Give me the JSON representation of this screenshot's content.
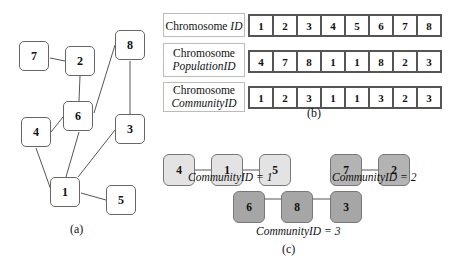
{
  "panel_a": {
    "caption": "(a)",
    "nodes": [
      {
        "id": "7",
        "label": "7"
      },
      {
        "id": "2",
        "label": "2"
      },
      {
        "id": "8",
        "label": "8"
      },
      {
        "id": "6",
        "label": "6"
      },
      {
        "id": "4",
        "label": "4"
      },
      {
        "id": "3",
        "label": "3"
      },
      {
        "id": "1",
        "label": "1"
      },
      {
        "id": "5",
        "label": "5"
      }
    ],
    "edges": [
      [
        "7",
        "2"
      ],
      [
        "2",
        "6"
      ],
      [
        "6",
        "4"
      ],
      [
        "6",
        "8"
      ],
      [
        "6",
        "1"
      ],
      [
        "8",
        "3"
      ],
      [
        "3",
        "1"
      ],
      [
        "4",
        "1"
      ],
      [
        "1",
        "5"
      ]
    ]
  },
  "panel_b": {
    "caption": "(b)",
    "rows": [
      {
        "label_plain": "Chromosome ",
        "label_italic": "ID",
        "values": [
          "1",
          "2",
          "3",
          "4",
          "5",
          "6",
          "7",
          "8"
        ]
      },
      {
        "label_plain": "Chromosome",
        "label_italic": "PopulationID",
        "values": [
          "4",
          "7",
          "8",
          "1",
          "1",
          "8",
          "2",
          "3"
        ]
      },
      {
        "label_plain": "Chromosome",
        "label_italic": "CommunityID",
        "values": [
          "1",
          "2",
          "3",
          "1",
          "1",
          "3",
          "2",
          "3"
        ]
      }
    ]
  },
  "panel_c": {
    "caption": "(c)",
    "communities": [
      {
        "caption": "CommunityID = 1",
        "nodes": [
          "4",
          "1",
          "5"
        ],
        "color": "#e3e3e3"
      },
      {
        "caption": "CommunityID = 2",
        "nodes": [
          "7",
          "2"
        ],
        "color": "#b3b3b3"
      },
      {
        "caption": "CommunityID = 3",
        "nodes": [
          "6",
          "8",
          "3"
        ],
        "color": "#a6a6a6"
      }
    ]
  }
}
